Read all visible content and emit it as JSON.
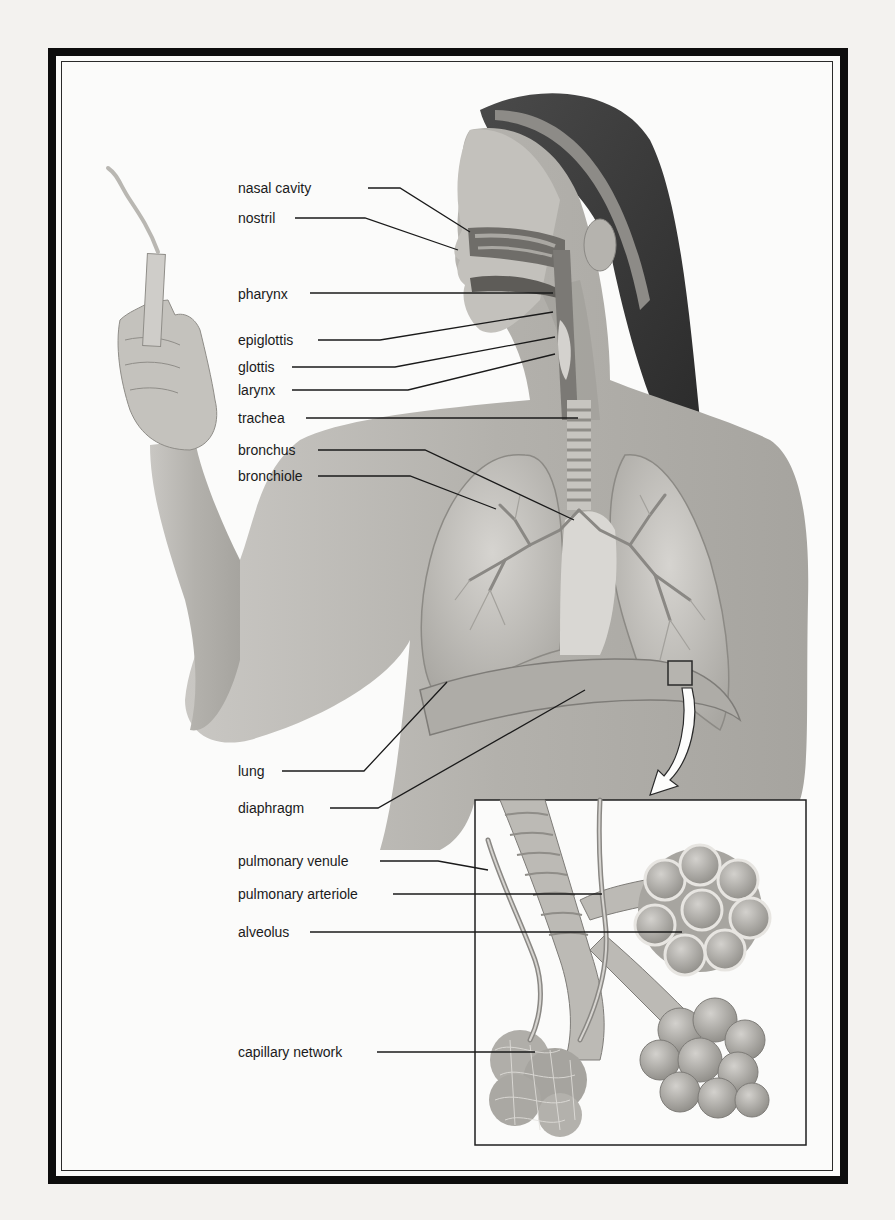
{
  "diagram": {
    "type": "anatomical-illustration",
    "colors": {
      "frame": "#0d0d0d",
      "ink": "#1a1a1a",
      "paper": "#fbfbfa",
      "skin": "#b9b7b2",
      "hair": "#3a3a3a"
    },
    "labels": [
      {
        "id": "nasal-cavity",
        "text": "nasal cavity",
        "x": 238,
        "y": 180,
        "line": [
          [
            368,
            188
          ],
          [
            400,
            188
          ],
          [
            470,
            232
          ]
        ]
      },
      {
        "id": "nostril",
        "text": "nostril",
        "x": 238,
        "y": 210,
        "line": [
          [
            295,
            218
          ],
          [
            365,
            218
          ],
          [
            458,
            250
          ]
        ]
      },
      {
        "id": "pharynx",
        "text": "pharynx",
        "x": 238,
        "y": 286,
        "line": [
          [
            310,
            293
          ],
          [
            553,
            293
          ]
        ]
      },
      {
        "id": "epiglottis",
        "text": "epiglottis",
        "x": 238,
        "y": 332,
        "line": [
          [
            318,
            340
          ],
          [
            380,
            340
          ],
          [
            553,
            312
          ]
        ]
      },
      {
        "id": "glottis",
        "text": "glottis",
        "x": 238,
        "y": 359,
        "line": [
          [
            292,
            367
          ],
          [
            395,
            367
          ],
          [
            555,
            337
          ]
        ]
      },
      {
        "id": "larynx",
        "text": "larynx",
        "x": 238,
        "y": 382,
        "line": [
          [
            292,
            390
          ],
          [
            408,
            390
          ],
          [
            555,
            354
          ]
        ]
      },
      {
        "id": "trachea",
        "text": "trachea",
        "x": 238,
        "y": 410,
        "line": [
          [
            306,
            418
          ],
          [
            578,
            418
          ]
        ]
      },
      {
        "id": "bronchus",
        "text": "bronchus",
        "x": 238,
        "y": 442,
        "line": [
          [
            318,
            450
          ],
          [
            425,
            450
          ],
          [
            574,
            520
          ]
        ]
      },
      {
        "id": "bronchiole",
        "text": "bronchiole",
        "x": 238,
        "y": 468,
        "line": [
          [
            318,
            476
          ],
          [
            410,
            476
          ],
          [
            496,
            509
          ]
        ]
      },
      {
        "id": "lung",
        "text": "lung",
        "x": 238,
        "y": 763,
        "line": [
          [
            282,
            771
          ],
          [
            364,
            771
          ],
          [
            447,
            682
          ]
        ]
      },
      {
        "id": "diaphragm",
        "text": "diaphragm",
        "x": 238,
        "y": 800,
        "line": [
          [
            330,
            808
          ],
          [
            378,
            808
          ],
          [
            585,
            690
          ]
        ]
      },
      {
        "id": "pulmonary-venule",
        "text": "pulmonary venule",
        "x": 238,
        "y": 853,
        "line": [
          [
            380,
            861
          ],
          [
            438,
            861
          ],
          [
            488,
            870
          ]
        ]
      },
      {
        "id": "pulmonary-arteriole",
        "text": "pulmonary arteriole",
        "x": 238,
        "y": 886,
        "line": [
          [
            393,
            894
          ],
          [
            602,
            894
          ]
        ]
      },
      {
        "id": "alveolus",
        "text": "alveolus",
        "x": 238,
        "y": 924,
        "line": [
          [
            310,
            932
          ],
          [
            682,
            932
          ]
        ]
      },
      {
        "id": "capillary-network",
        "text": "capillary network",
        "x": 238,
        "y": 1044,
        "line": [
          [
            377,
            1052
          ],
          [
            535,
            1052
          ]
        ]
      }
    ],
    "inset": {
      "x": 475,
      "y": 800,
      "width": 331,
      "height": 345,
      "description": "magnified view of bronchiole with alveoli and capillary network"
    },
    "magnify_marker": {
      "x": 668,
      "y": 661,
      "size": 24
    },
    "prop": "smoking cigarette held in raised hand"
  }
}
